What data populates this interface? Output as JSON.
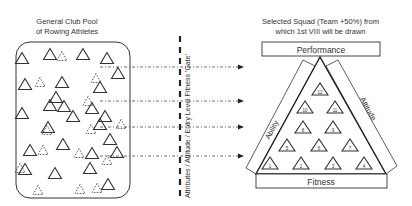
{
  "pool": {
    "title_line1": "General Club Pool",
    "title_line2": "of Rowing Athletes",
    "solid_triangles": [
      [
        22,
        58
      ],
      [
        50,
        54
      ],
      [
        83,
        54
      ],
      [
        107,
        58
      ],
      [
        62,
        82
      ],
      [
        118,
        73
      ],
      [
        25,
        84
      ],
      [
        56,
        97
      ],
      [
        100,
        87
      ],
      [
        50,
        105
      ],
      [
        64,
        106
      ],
      [
        92,
        108
      ],
      [
        22,
        113
      ],
      [
        73,
        116
      ],
      [
        105,
        116
      ],
      [
        48,
        127
      ],
      [
        100,
        124
      ],
      [
        110,
        139
      ],
      [
        30,
        150
      ],
      [
        63,
        144
      ],
      [
        92,
        153
      ],
      [
        117,
        152
      ],
      [
        25,
        169
      ],
      [
        55,
        173
      ],
      [
        90,
        168
      ],
      [
        108,
        184
      ]
    ],
    "dashed_triangles": [
      [
        62,
        56
      ],
      [
        40,
        82
      ],
      [
        96,
        78
      ],
      [
        88,
        101
      ],
      [
        121,
        124
      ],
      [
        47,
        130
      ],
      [
        91,
        129
      ],
      [
        43,
        150
      ],
      [
        79,
        153
      ],
      [
        107,
        160
      ],
      [
        20,
        168
      ],
      [
        38,
        190
      ],
      [
        80,
        189
      ],
      [
        97,
        188
      ]
    ]
  },
  "gate": {
    "label": "Attributes / Attitude / Entry Level Fitness 'Gate'"
  },
  "arrows": [
    67,
    101,
    127,
    156
  ],
  "squad": {
    "title_line1": "Selected Squad (Team +50%) from",
    "title_line2": "which 1st VIII will be drawn",
    "top_label": "Performance",
    "bottom_label": "Fitness",
    "left_label": "Ability",
    "right_label": "Attitude",
    "athletes": [
      {
        "n": "1",
        "x": 270,
        "y": 163
      },
      {
        "n": "2",
        "x": 301,
        "y": 163
      },
      {
        "n": "3",
        "x": 333,
        "y": 163
      },
      {
        "n": "4",
        "x": 364,
        "y": 163
      },
      {
        "n": "5",
        "x": 287,
        "y": 145
      },
      {
        "n": "6",
        "x": 319,
        "y": 145
      },
      {
        "n": "7",
        "x": 350,
        "y": 145
      },
      {
        "n": "8",
        "x": 303,
        "y": 127
      },
      {
        "n": "9",
        "x": 333,
        "y": 127
      },
      {
        "n": "10",
        "x": 305,
        "y": 107
      },
      {
        "n": "11",
        "x": 335,
        "y": 107
      },
      {
        "n": "12",
        "x": 320,
        "y": 89
      }
    ]
  },
  "colors": {
    "line": "#333333",
    "text": "#333333",
    "background": "#ffffff"
  }
}
